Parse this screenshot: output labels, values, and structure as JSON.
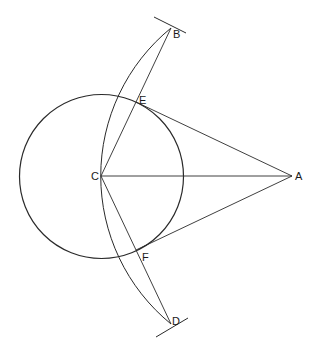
{
  "diagram": {
    "type": "geometric-construction",
    "points": {
      "A": {
        "label": "A",
        "x": 292,
        "y": 176
      },
      "B": {
        "label": "B",
        "x": 171,
        "y": 28
      },
      "C": {
        "label": "C",
        "x": 101,
        "y": 176
      },
      "D": {
        "label": "D",
        "x": 171,
        "y": 324
      },
      "E": {
        "label": "E",
        "x": 136,
        "y": 102
      },
      "F": {
        "label": "F",
        "x": 136,
        "y": 250
      }
    },
    "circle": {
      "center": "C",
      "radius": 82
    },
    "arc": {
      "center": "A",
      "through": [
        "B",
        "C",
        "D"
      ]
    },
    "segments": [
      [
        "C",
        "A"
      ],
      [
        "C",
        "B"
      ],
      [
        "C",
        "D"
      ],
      [
        "E",
        "A"
      ],
      [
        "F",
        "A"
      ]
    ],
    "stroke_color": "#2a2a2a",
    "background": "#ffffff"
  }
}
